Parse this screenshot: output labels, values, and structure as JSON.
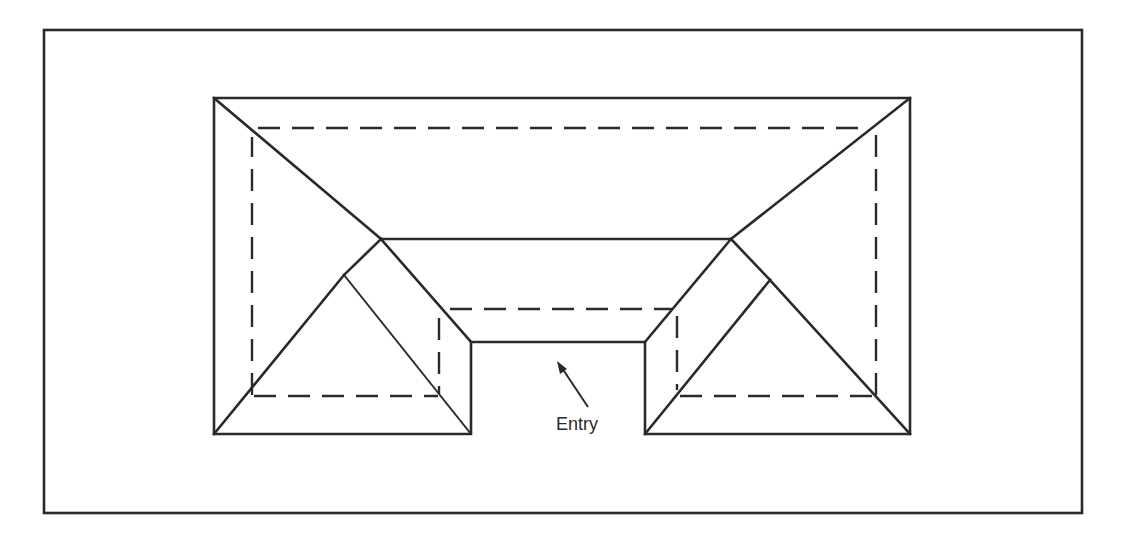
{
  "diagram": {
    "type": "roof-plan",
    "labels": {
      "entry": "Entry"
    },
    "legend": {
      "solid_line": "roof edges, hips and ridges",
      "dashed_line": "wall lines"
    },
    "colors": {
      "line": "#2a2a2a",
      "background": "#ffffff"
    }
  }
}
